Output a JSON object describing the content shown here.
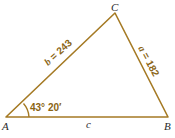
{
  "diagram": {
    "type": "triangle",
    "colors": {
      "line": "#a57a24",
      "label": "#8a6414",
      "vertex": "#2a2a2a"
    },
    "vertices": [
      {
        "name": "A",
        "x": 6,
        "y": 117
      },
      {
        "name": "B",
        "x": 168,
        "y": 117
      },
      {
        "name": "C",
        "x": 115,
        "y": 13
      }
    ],
    "sides": {
      "a": {
        "var": "a",
        "eq": " = ",
        "value": "182"
      },
      "b": {
        "var": "b",
        "eq": " = ",
        "value": "243"
      },
      "c": {
        "var": "c"
      }
    },
    "angle_A": {
      "label": "43° 20′"
    }
  }
}
